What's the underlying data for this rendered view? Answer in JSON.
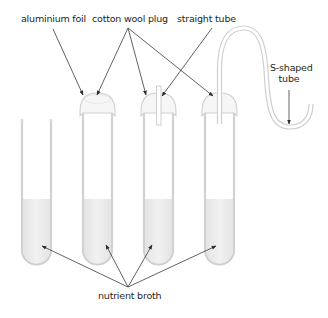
{
  "figure": {
    "type": "scientific-apparatus-diagram"
  },
  "labels": {
    "aluminium_foil": "aluminium foil",
    "cotton_wool_plug": "cotton wool plug",
    "straight_tube": "straight tube",
    "s_shaped_tube_line1": "S-shaped",
    "s_shaped_tube_line2": "tube",
    "nutrient_broth": "nutrient broth"
  },
  "tubes": [
    {
      "id": 1,
      "closure": "open"
    },
    {
      "id": 2,
      "closure": "aluminium foil / cotton wool plug"
    },
    {
      "id": 3,
      "closure": "cotton wool plug with straight tube"
    },
    {
      "id": 4,
      "closure": "cotton wool plug with S-shaped tube"
    }
  ],
  "colors": {
    "glass": "#d9d9d9",
    "broth": "#ececec",
    "arrow": "#3a3a3a",
    "text": "#231f20"
  }
}
